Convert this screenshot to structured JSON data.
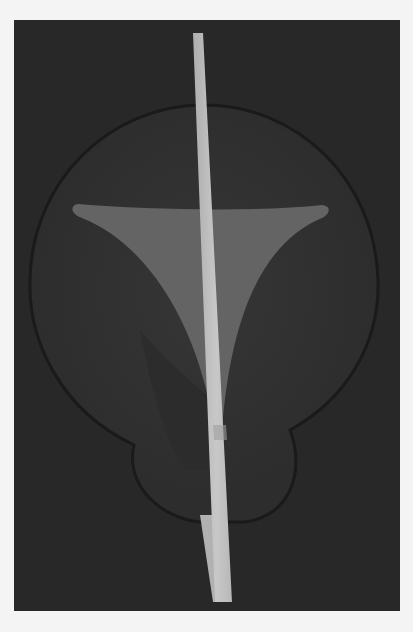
{
  "image": {
    "description": "Abstract 3D render: dark panel with a dark circular/bulb shape, a lighter gray curved triangle, and a thin pale vertical rod",
    "colors": {
      "page_background": "#f4f4f4",
      "panel": "#2b2b2b",
      "circle": "#353535",
      "circle_edge": "#1a1a1a",
      "triangle": "#6e6e6e",
      "rod_light": "#cfcfcf",
      "rod_shade": "#a8a8a8"
    }
  }
}
